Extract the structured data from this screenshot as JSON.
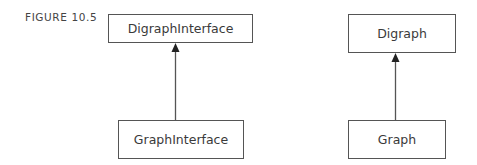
{
  "figure": {
    "label": "FIGURE 10.5"
  },
  "diagram": {
    "type": "uml-inheritance",
    "colors": {
      "line": "#555555",
      "text": "#3a3a3a",
      "background": "#ffffff"
    },
    "nodes": [
      {
        "id": "digraph-interface",
        "label": "DigraphInterface"
      },
      {
        "id": "graph-interface",
        "label": "GraphInterface"
      },
      {
        "id": "digraph",
        "label": "Digraph"
      },
      {
        "id": "graph",
        "label": "Graph"
      }
    ],
    "edges": [
      {
        "from": "graph-interface",
        "to": "digraph-interface",
        "arrow": "filled-triangle"
      },
      {
        "from": "graph",
        "to": "digraph",
        "arrow": "filled-triangle"
      }
    ]
  }
}
